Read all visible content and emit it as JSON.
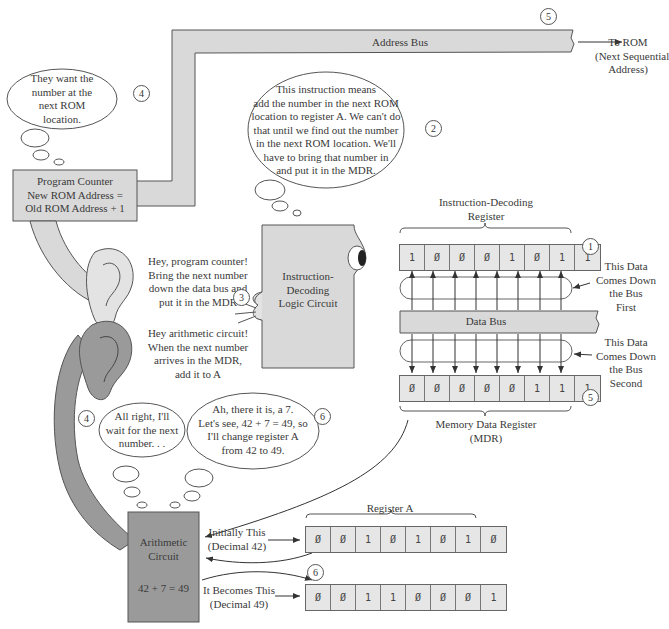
{
  "address_bus": {
    "label": "Address Bus",
    "destination": [
      "To ROM",
      "(Next Sequential",
      "Address)"
    ],
    "step": "5"
  },
  "program_counter": {
    "lines": [
      "Program Counter",
      "New ROM Address =",
      "Old ROM Address + 1"
    ],
    "thought": [
      "They want the",
      "number at the",
      "next ROM",
      "location."
    ],
    "step": "4"
  },
  "decoder_thought": {
    "lines": [
      "This instruction means",
      "add the number in the next ROM",
      "location to register A. We can't do",
      "that until we find out the number",
      "in the next ROM location. We'll",
      "have to bring that number in",
      "and put it in the MDR."
    ],
    "step": "2"
  },
  "decoder": {
    "lines": [
      "Instruction-",
      "Decoding",
      "Logic Circuit"
    ],
    "speech_1": [
      "Hey, program counter!",
      "Bring the next number",
      "down the data bus and",
      "put it in the MDR"
    ],
    "speech_2": [
      "Hey arithmetic circuit!",
      "When the next number",
      "arrives in the MDR,",
      "add it to A"
    ],
    "step": "3"
  },
  "instruction_register": {
    "title": [
      "Instruction-Decoding",
      "Register"
    ],
    "bits": [
      "1",
      "Ø",
      "Ø",
      "Ø",
      "1",
      "Ø",
      "1",
      "1"
    ],
    "step": "1",
    "note": [
      "This Data",
      "Comes Down",
      "the Bus",
      "First"
    ]
  },
  "data_bus": {
    "label": "Data Bus"
  },
  "mdr": {
    "title": [
      "Memory Data Register",
      "(MDR)"
    ],
    "bits": [
      "Ø",
      "Ø",
      "Ø",
      "Ø",
      "Ø",
      "1",
      "1",
      "1"
    ],
    "step": "5",
    "note": [
      "This Data",
      "Comes Down",
      "the Bus",
      "Second"
    ]
  },
  "arithmetic": {
    "lines": [
      "Arithmetic",
      "Circuit"
    ],
    "equation": "42 + 7 = 49",
    "thought_wait": [
      "All right, I'll",
      "wait for the next",
      "number. . ."
    ],
    "thought_wait_step": "4",
    "thought_change": [
      "Ah, there it is, a 7.",
      "Let's see, 42 + 7 = 49, so",
      "I'll change register A",
      "from 42 to 49."
    ],
    "thought_change_step": "6"
  },
  "register_a": {
    "title": "Register A",
    "initial_label": [
      "Initially This",
      "(Decimal 42)"
    ],
    "initial_bits": [
      "Ø",
      "Ø",
      "1",
      "Ø",
      "1",
      "Ø",
      "1",
      "Ø"
    ],
    "final_label": [
      "It Becomes This",
      "(Decimal 49)"
    ],
    "final_bits": [
      "Ø",
      "Ø",
      "1",
      "1",
      "Ø",
      "Ø",
      "Ø",
      "1"
    ],
    "step": "6"
  },
  "colors": {
    "box_fill": "#d9d9d9",
    "dark_fill": "#9a9a9a",
    "stroke": "#555555",
    "text": "#3a3a3a"
  }
}
